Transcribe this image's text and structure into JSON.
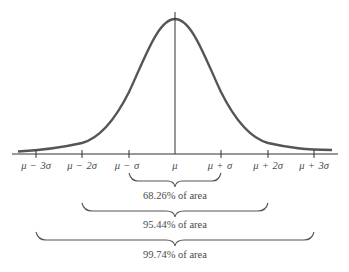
{
  "diagram": {
    "axis_labels": [
      {
        "id": "m3s",
        "mu": "μ",
        "op": "−",
        "k": "3σ"
      },
      {
        "id": "m2s",
        "mu": "μ",
        "op": "−",
        "k": "2σ"
      },
      {
        "id": "m1s",
        "mu": "μ",
        "op": "−",
        "k": "σ"
      },
      {
        "id": "mu",
        "mu": "μ",
        "op": "",
        "k": ""
      },
      {
        "id": "p1s",
        "mu": "μ",
        "op": "+",
        "k": "σ"
      },
      {
        "id": "p2s",
        "mu": "μ",
        "op": "+",
        "k": "2σ"
      },
      {
        "id": "p3s",
        "mu": "μ",
        "op": "+",
        "k": "3σ"
      }
    ],
    "braces": [
      {
        "range": "μ ± σ",
        "label": "68.26% of area"
      },
      {
        "range": "μ ± 2σ",
        "label": "95.44% of area"
      },
      {
        "range": "μ ± 3σ",
        "label": "99.74% of area"
      }
    ],
    "colors": {
      "curve": "#555555",
      "axis": "#333333",
      "text": "#4a4a4a"
    }
  }
}
